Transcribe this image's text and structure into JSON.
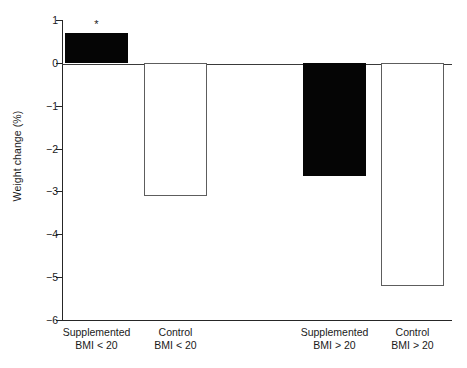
{
  "chart_data": {
    "type": "bar",
    "title": "",
    "subtitle": "",
    "xlabel": "",
    "ylabel": "Weight change (%)",
    "ylim": [
      -6,
      1
    ],
    "yticks": [
      1,
      0,
      -1,
      -2,
      -3,
      -4,
      -5,
      -6
    ],
    "ytick_labels": [
      "1",
      "0",
      "−1",
      "−2",
      "−3",
      "−4",
      "−5",
      "−6"
    ],
    "grid": false,
    "legend": "none",
    "zero_line": 0,
    "categories": [
      "Supplemented BMI < 20",
      "Control BMI < 20",
      "Supplemented BMI > 20",
      "Control BMI > 20"
    ],
    "category_labels": [
      {
        "line1": "Supplemented",
        "line2": "BMI < 20"
      },
      {
        "line1": "Control",
        "line2": "BMI < 20"
      },
      {
        "line1": "Supplemented",
        "line2": "BMI > 20"
      },
      {
        "line1": "Control",
        "line2": "BMI > 20"
      }
    ],
    "values": [
      0.7,
      -3.1,
      -2.65,
      -5.2
    ],
    "bar_styles": [
      "filled",
      "open",
      "filled",
      "open"
    ],
    "annotations": [
      {
        "category_index": 0,
        "text": "*",
        "value": 0.7
      }
    ],
    "colors": {
      "filled": "#050505",
      "open_fill": "#ffffff",
      "open_border": "#5d5d5d",
      "axis": "#262626",
      "text": "#1a1a1a",
      "background": "#ffffff"
    }
  }
}
